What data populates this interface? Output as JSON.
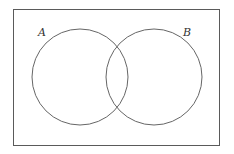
{
  "diagram": {
    "type": "venn",
    "universe": {
      "x": 13,
      "y": 9,
      "width": 206,
      "height": 136,
      "stroke": "#5a5a5a"
    },
    "sets": [
      {
        "label": "A",
        "cx": 80,
        "cy": 77,
        "r": 48,
        "label_x": 38,
        "label_y": 36,
        "stroke": "#666666"
      },
      {
        "label": "B",
        "cx": 154,
        "cy": 77,
        "r": 48,
        "label_x": 183,
        "label_y": 36,
        "stroke": "#666666"
      }
    ]
  }
}
